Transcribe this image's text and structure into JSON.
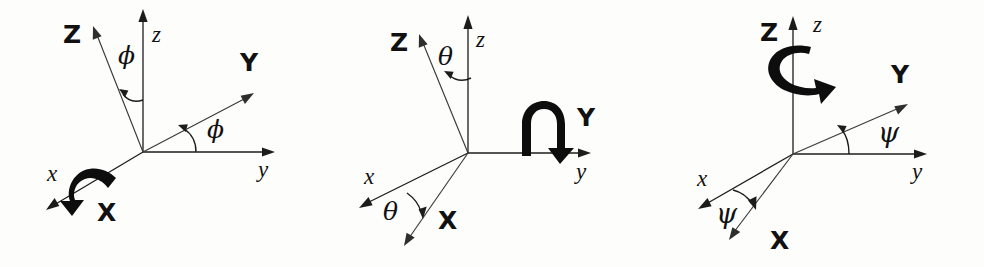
{
  "figure": {
    "name": "euler-angle-rotation-sequence",
    "background_color": "#fdfdfc",
    "ink_color": "#1c1c1c",
    "panel_count": 3
  },
  "panels": [
    {
      "id": "panel-roll-phi",
      "angle_symbol": "ϕ",
      "rotation_axis": "x",
      "spin_arrow": "arc-around-x-axis",
      "labels": {
        "body_z": "Z",
        "body_y": "Y",
        "body_x": "X",
        "space_z": "z",
        "space_y": "y",
        "space_x": "x",
        "angle_upper": "ϕ",
        "angle_lower": "ϕ"
      }
    },
    {
      "id": "panel-pitch-theta",
      "angle_symbol": "θ",
      "rotation_axis": "y",
      "spin_arrow": "arc-around-y-axis",
      "labels": {
        "body_z": "Z",
        "body_y": "Y",
        "body_x": "X",
        "space_z": "z",
        "space_y": "y",
        "space_x": "x",
        "angle_upper": "θ",
        "angle_lower": "θ"
      }
    },
    {
      "id": "panel-yaw-psi",
      "angle_symbol": "ψ",
      "rotation_axis": "z",
      "spin_arrow": "arc-around-z-axis",
      "labels": {
        "body_z": "Z",
        "body_y": "Y",
        "body_x": "X",
        "space_z": "z",
        "space_y": "y",
        "space_x": "x",
        "angle_upper": "ψ",
        "angle_lower": "ψ"
      }
    }
  ]
}
